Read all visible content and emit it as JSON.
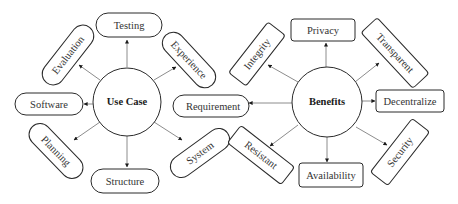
{
  "diagram": {
    "colors": {
      "background": "#ffffff",
      "stroke": "#2a2a2a",
      "edge": "#6e6e6e",
      "text": "#333333"
    },
    "left_hub": {
      "label": "Use Case",
      "shape": "circle",
      "node_shape": "pill",
      "nodes": [
        {
          "label": "Testing",
          "direction": "up"
        },
        {
          "label": "Experience",
          "direction": "up-right"
        },
        {
          "label": "Requirement",
          "direction": "right"
        },
        {
          "label": "System",
          "direction": "down-right"
        },
        {
          "label": "Structure",
          "direction": "down"
        },
        {
          "label": "Planning",
          "direction": "down-left"
        },
        {
          "label": "Software",
          "direction": "left"
        },
        {
          "label": "Evaluation",
          "direction": "up-left"
        }
      ]
    },
    "right_hub": {
      "label": "Benefits",
      "shape": "circle",
      "node_shape": "rounded-rectangle",
      "nodes": [
        {
          "label": "Privacy",
          "direction": "up"
        },
        {
          "label": "Transparent",
          "direction": "up-right"
        },
        {
          "label": "Decentralize",
          "direction": "right"
        },
        {
          "label": "Security",
          "direction": "down-right"
        },
        {
          "label": "Availability",
          "direction": "down"
        },
        {
          "label": "Resistant",
          "direction": "down-left"
        },
        {
          "label": "Integrity",
          "direction": "up-left"
        }
      ]
    },
    "links": [
      {
        "from": "Benefits",
        "to": "Requirement"
      }
    ]
  }
}
